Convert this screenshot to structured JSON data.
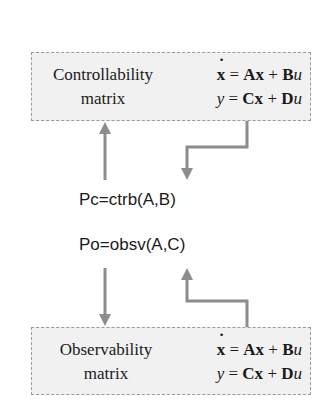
{
  "top_box": {
    "label_line1": "Controllability",
    "label_line2": "matrix",
    "eq1": {
      "lhs": "x",
      "eq": " = ",
      "t1": "Ax",
      "plus": " + ",
      "t2": "B",
      "t3": "u"
    },
    "eq2": {
      "lhs": "y",
      "eq": " = ",
      "t1": "Cx",
      "plus": " + ",
      "t2": "D",
      "t3": "u"
    }
  },
  "commands": {
    "ctrb": "Pc=ctrb(A,B)",
    "obsv": "Po=obsv(A,C)"
  },
  "bottom_box": {
    "label_line1": "Observability",
    "label_line2": "matrix",
    "eq1": {
      "lhs": "x",
      "eq": " = ",
      "t1": "Ax",
      "plus": " + ",
      "t2": "B",
      "t3": "u"
    },
    "eq2": {
      "lhs": "y",
      "eq": " = ",
      "t1": "Cx",
      "plus": " + ",
      "t2": "D",
      "t3": "u"
    }
  },
  "colors": {
    "arrow": "#8c8c8c",
    "box_fill": "#f1f1f1",
    "box_border": "#9a9a9a"
  }
}
